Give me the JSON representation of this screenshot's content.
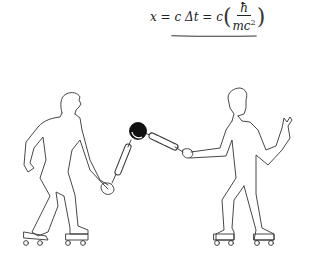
{
  "equation": {
    "lhs": "x = c Δt = c",
    "numerator": "ħ",
    "denominator": "mc",
    "denominator_exponent": "2",
    "open_paren": "(",
    "close_paren": ")",
    "underline_color": "#333333"
  },
  "illustration": {
    "description": "Two roller skaters each holding a spring connected to a central black ball",
    "figures": [
      {
        "name": "left-skater",
        "holding": "spring"
      },
      {
        "name": "right-skater",
        "holding": "spring",
        "other_hand": "raised"
      }
    ],
    "ball_color": "#111111",
    "line_color": "#333333"
  }
}
